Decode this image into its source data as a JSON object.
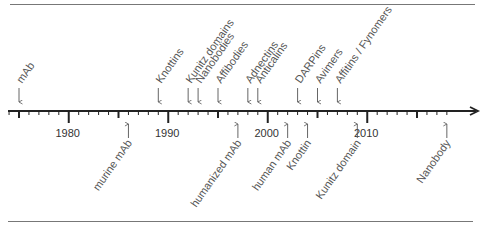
{
  "diagram": {
    "type": "timeline",
    "axis": {
      "start_year": 1974,
      "end_year": 2018,
      "major_ticks": [
        1980,
        1990,
        2000,
        2010
      ],
      "medium_ticks": [
        1975,
        1985,
        1995,
        2005,
        2015
      ],
      "year_labels": [
        "1980",
        "1990",
        "2000",
        "2010"
      ]
    },
    "above_axis": {
      "description": "Discovery of scaffolds",
      "events": [
        {
          "label": "mAb",
          "year": 1975
        },
        {
          "label": "Knottins",
          "year": 1989
        },
        {
          "label": "Kunitz domains",
          "year": 1992
        },
        {
          "label": "Nanobodies",
          "year": 1993
        },
        {
          "label": "Affibodies",
          "year": 1995
        },
        {
          "label": "Adnectins",
          "year": 1998
        },
        {
          "label": "Anticalins",
          "year": 1999
        },
        {
          "label": "DARPins",
          "year": 2003
        },
        {
          "label": "Avimers",
          "year": 2005
        },
        {
          "label": "Affitins / Fynomers",
          "year": 2007
        }
      ]
    },
    "below_axis": {
      "description": "Approval milestones",
      "events": [
        {
          "label": "murine mAb",
          "year": 1986
        },
        {
          "label": "humanized mAb",
          "year": 1997
        },
        {
          "label": "human mAb",
          "year": 2002
        },
        {
          "label": "Knottin",
          "year": 2004
        },
        {
          "label": "Kunitz domain",
          "year": 2009
        },
        {
          "label": "Nanobody",
          "year": 2018
        }
      ]
    },
    "colors": {
      "axis": "#222222",
      "text": "#555555",
      "rule": "#777777",
      "background": "#ffffff"
    }
  }
}
